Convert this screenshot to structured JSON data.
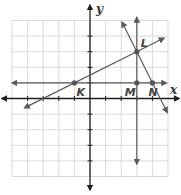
{
  "diagram": {
    "type": "coordinate-plane",
    "x_range": [
      -5,
      5
    ],
    "y_range": [
      -5,
      5
    ],
    "axis_labels": {
      "x": "x",
      "y": "y"
    },
    "colors": {
      "grid": "#cfcfcf",
      "axis": "#1e1e1e",
      "line": "#5a5a5a",
      "label": "#444444"
    },
    "points": [
      {
        "name": "K",
        "x": -1,
        "y": 1,
        "label_pos": "below-right"
      },
      {
        "name": "L",
        "x": 3,
        "y": 3,
        "label_pos": "above-right"
      },
      {
        "name": "M",
        "x": 3,
        "y": 1,
        "label_pos": "below-left"
      },
      {
        "name": "N",
        "x": 4,
        "y": 1,
        "label_pos": "below"
      }
    ],
    "lines": [
      {
        "name": "line-KL",
        "through": [
          "K",
          "L"
        ],
        "from": [
          -4.2,
          -0.6
        ],
        "to": [
          4.75,
          3.875
        ]
      },
      {
        "name": "line-KN-horizontal",
        "through": [
          "K",
          "M",
          "N"
        ],
        "from": [
          -5,
          1
        ],
        "to": [
          4.9,
          1
        ]
      },
      {
        "name": "line-ML-vertical",
        "through": [
          "M",
          "L"
        ],
        "from": [
          3,
          -4.2
        ],
        "to": [
          3,
          5.2
        ]
      },
      {
        "name": "line-LN",
        "through": [
          "L",
          "N"
        ],
        "from": [
          2.05,
          4.9
        ],
        "to": [
          4.95,
          -0.9
        ]
      }
    ]
  }
}
